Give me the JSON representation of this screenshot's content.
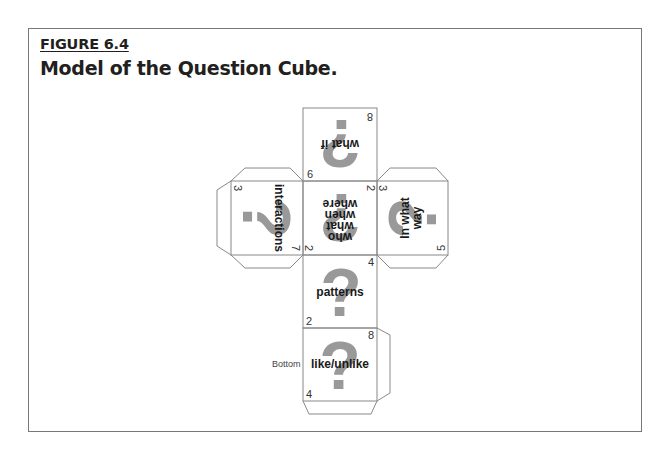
{
  "figure": {
    "label": "FIGURE 6.4",
    "title": "Model of the Question Cube."
  },
  "cube_net": {
    "line_color": "#888888",
    "question_mark_color": "#999999",
    "question_mark_glyph": "?",
    "bottom_label": "Bottom",
    "faces": {
      "top": {
        "text_lines": [
          "what if"
        ],
        "numbers": [
          "8",
          "6"
        ],
        "orientation": "upside-down"
      },
      "left": {
        "text_lines": [
          "interactions"
        ],
        "numbers": [
          "3",
          "7"
        ],
        "orientation": "rotated-90-cw"
      },
      "center": {
        "text_lines": [
          "who",
          "what",
          "when",
          "where"
        ],
        "numbers": [
          "2",
          "2"
        ],
        "orientation": "upside-down"
      },
      "right": {
        "text_lines": [
          "In what",
          "way"
        ],
        "numbers": [
          "3",
          "5"
        ],
        "orientation": "rotated-90-ccw"
      },
      "front": {
        "text_lines": [
          "patterns"
        ],
        "numbers": [
          "4",
          "2"
        ],
        "orientation": "upright"
      },
      "bottom": {
        "text_lines": [
          "like/unlike"
        ],
        "numbers": [
          "8",
          "4"
        ],
        "orientation": "upright"
      }
    }
  }
}
